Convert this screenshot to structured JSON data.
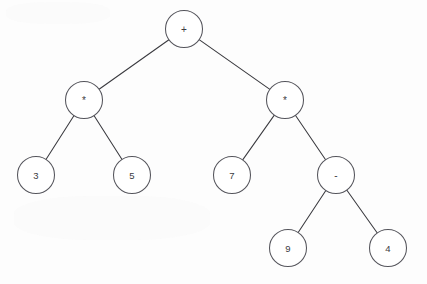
{
  "diagram": {
    "type": "binary-expression-tree",
    "background_color": "#fdfdfd",
    "node_fill_color": "#ffffff",
    "node_stroke_color": "#55555c",
    "edge_color": "#3a3a3f",
    "label_color": "#3c3c42",
    "node_radius": 18.5,
    "expression": "3 * 5 + 7 * (9 - 4)",
    "nodes": [
      {
        "id": "root",
        "label": "+",
        "kind": "operator",
        "x": 184,
        "y": 29,
        "level": 0
      },
      {
        "id": "mulL",
        "label": "*",
        "kind": "operator",
        "x": 84,
        "y": 100,
        "level": 1
      },
      {
        "id": "mulR",
        "label": "*",
        "kind": "operator",
        "x": 285,
        "y": 100,
        "level": 1
      },
      {
        "id": "n3",
        "label": "3",
        "kind": "operand",
        "x": 36,
        "y": 175,
        "level": 2
      },
      {
        "id": "n5",
        "label": "5",
        "kind": "operand",
        "x": 132,
        "y": 175,
        "level": 2
      },
      {
        "id": "n7",
        "label": "7",
        "kind": "operand",
        "x": 232,
        "y": 175,
        "level": 2
      },
      {
        "id": "sub",
        "label": "-",
        "kind": "operator",
        "x": 336,
        "y": 175,
        "level": 2
      },
      {
        "id": "n9",
        "label": "9",
        "kind": "operand",
        "x": 288,
        "y": 248,
        "level": 3
      },
      {
        "id": "n4",
        "label": "4",
        "kind": "operand",
        "x": 388,
        "y": 248,
        "level": 3
      }
    ],
    "edges": [
      {
        "from": "root",
        "to": "mulL"
      },
      {
        "from": "root",
        "to": "mulR"
      },
      {
        "from": "mulL",
        "to": "n3"
      },
      {
        "from": "mulL",
        "to": "n5"
      },
      {
        "from": "mulR",
        "to": "n7"
      },
      {
        "from": "mulR",
        "to": "sub"
      },
      {
        "from": "sub",
        "to": "n9"
      },
      {
        "from": "sub",
        "to": "n4"
      }
    ]
  }
}
